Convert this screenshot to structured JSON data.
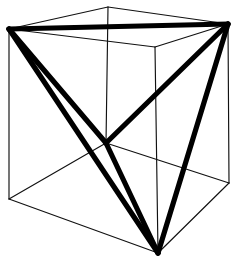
{
  "figure": {
    "description": "Line drawing of a wireframe cube in oblique projection with a regular tetrahedron inscribed by joining four alternate cube vertices, drawn with heavy strokes.",
    "background_color": "#ffffff",
    "line_color": "#111111",
    "tetrahedron_color": "#000000",
    "cube_edge_width_px": 1.15,
    "tetrahedron_edge_width_px": 5.2,
    "canvas": {
      "width": 237,
      "height": 262
    },
    "vertices": {
      "top_left": {
        "label": "top-left",
        "x": 9,
        "y": 29
      },
      "top_back": {
        "label": "top-back",
        "x": 108,
        "y": 7
      },
      "top_right": {
        "label": "top-right",
        "x": 228,
        "y": 24
      },
      "top_front": {
        "label": "top-front",
        "x": 155,
        "y": 47
      },
      "bottom_left": {
        "label": "bottom-left",
        "x": 9,
        "y": 199
      },
      "bottom_back": {
        "label": "bottom-back",
        "x": 106,
        "y": 143
      },
      "bottom_right": {
        "label": "bottom-right",
        "x": 229,
        "y": 183
      },
      "bottom_front": {
        "label": "bottom-front",
        "x": 158,
        "y": 253
      }
    },
    "cube_edges": [
      {
        "name": "top-left-to-top-back",
        "from": "top_left",
        "to": "top_back"
      },
      {
        "name": "top-back-to-top-right",
        "from": "top_back",
        "to": "top_right"
      },
      {
        "name": "top-right-to-top-front",
        "from": "top_right",
        "to": "top_front"
      },
      {
        "name": "top-front-to-top-left",
        "from": "top_front",
        "to": "top_left"
      },
      {
        "name": "bottom-left-to-bottom-back",
        "from": "bottom_left",
        "to": "bottom_back"
      },
      {
        "name": "bottom-back-to-bottom-right",
        "from": "bottom_back",
        "to": "bottom_right"
      },
      {
        "name": "bottom-right-to-bottom-front",
        "from": "bottom_right",
        "to": "bottom_front"
      },
      {
        "name": "bottom-front-to-bottom-left",
        "from": "bottom_front",
        "to": "bottom_left"
      },
      {
        "name": "vertical-left",
        "from": "top_left",
        "to": "bottom_left"
      },
      {
        "name": "vertical-back",
        "from": "top_back",
        "to": "bottom_back"
      },
      {
        "name": "vertical-right",
        "from": "top_right",
        "to": "bottom_right"
      },
      {
        "name": "vertical-front",
        "from": "top_front",
        "to": "bottom_front"
      }
    ],
    "tetrahedron_vertices": [
      "top_left",
      "top_right",
      "bottom_back",
      "bottom_front"
    ],
    "tetrahedron_edges": [
      {
        "name": "tetra-top-left-to-top-right",
        "from": "top_left",
        "to": "top_right"
      },
      {
        "name": "tetra-top-left-to-bottom-back",
        "from": "top_left",
        "to": "bottom_back"
      },
      {
        "name": "tetra-top-left-to-bottom-front",
        "from": "top_left",
        "to": "bottom_front"
      },
      {
        "name": "tetra-top-right-to-bottom-back",
        "from": "top_right",
        "to": "bottom_back"
      },
      {
        "name": "tetra-top-right-to-bottom-front",
        "from": "top_right",
        "to": "bottom_front"
      },
      {
        "name": "tetra-bottom-back-to-bottom-front",
        "from": "bottom_back",
        "to": "bottom_front"
      }
    ]
  }
}
